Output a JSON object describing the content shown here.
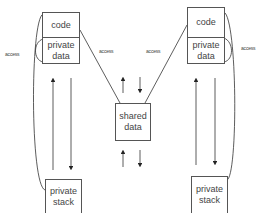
{
  "diagram": {
    "type": "threads-shared-memory",
    "left_thread": {
      "code_label": "code",
      "private_data_label": "private\ndata",
      "stack_label": "private\nstack",
      "access_label": "access"
    },
    "right_thread": {
      "code_label": "code",
      "private_data_label": "private\ndata",
      "stack_label": "private\nstack",
      "access_label": "access"
    },
    "shared": {
      "label": "shared\ndata",
      "left_access_label": "access",
      "right_access_label": "access"
    },
    "colors": {
      "line": "#333333",
      "border": "#555555",
      "text": "#444444",
      "background": "#ffffff"
    }
  }
}
